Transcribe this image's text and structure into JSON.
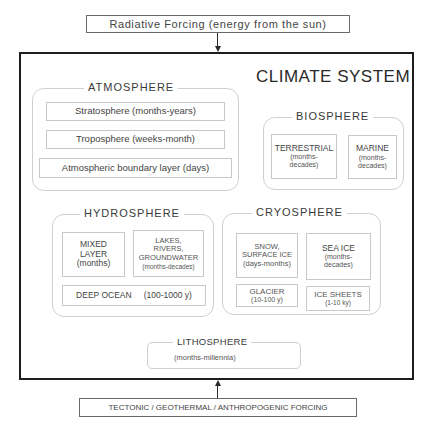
{
  "top_forcing": {
    "label": "Radiative Forcing (energy from the sun)"
  },
  "bottom_forcing": {
    "label": "TECTONIC / GEOTHERMAL / ANTHROPOGENIC FORCING"
  },
  "system": {
    "title": "CLIMATE SYSTEM"
  },
  "atmosphere": {
    "title": "ATMOSPHERE",
    "items": [
      {
        "label": "Stratosphere  (months-years)"
      },
      {
        "label": "Troposphere  (weeks-month)"
      },
      {
        "label": "Atmospheric boundary layer  (days)"
      }
    ]
  },
  "biosphere": {
    "title": "BIOSPHERE",
    "items": [
      {
        "name": "TERRESTRIAL",
        "line1": "(months-",
        "line2": "decades)"
      },
      {
        "name": "MARINE",
        "line1": "(months-",
        "line2": "decades)"
      }
    ]
  },
  "hydrosphere": {
    "title": "HYDROSPHERE",
    "mixed": {
      "line1": "MIXED",
      "line2": "LAYER",
      "time": "(months)"
    },
    "lakes": {
      "line1": "LAKES,",
      "line2": "RIVERS,",
      "line3": "GROUNDWATER",
      "time": "(months-decades)"
    },
    "deep": {
      "name": "DEEP OCEAN",
      "time": "(100-1000 y)"
    }
  },
  "cryosphere": {
    "title": "CRYOSPHERE",
    "snow": {
      "line1": "SNOW,",
      "line2": "SURFACE ICE",
      "time": "(days-months)"
    },
    "seaice": {
      "name": "SEA ICE",
      "line1": "(months-",
      "line2": "decades)"
    },
    "glacier": {
      "name": "GLACIER",
      "time": "(10-100 y)"
    },
    "icesheets": {
      "name": "ICE SHEETS",
      "time": "(1-10 ky)"
    }
  },
  "lithosphere": {
    "title": "LITHOSPHERE",
    "time": "(months-millennia)"
  }
}
